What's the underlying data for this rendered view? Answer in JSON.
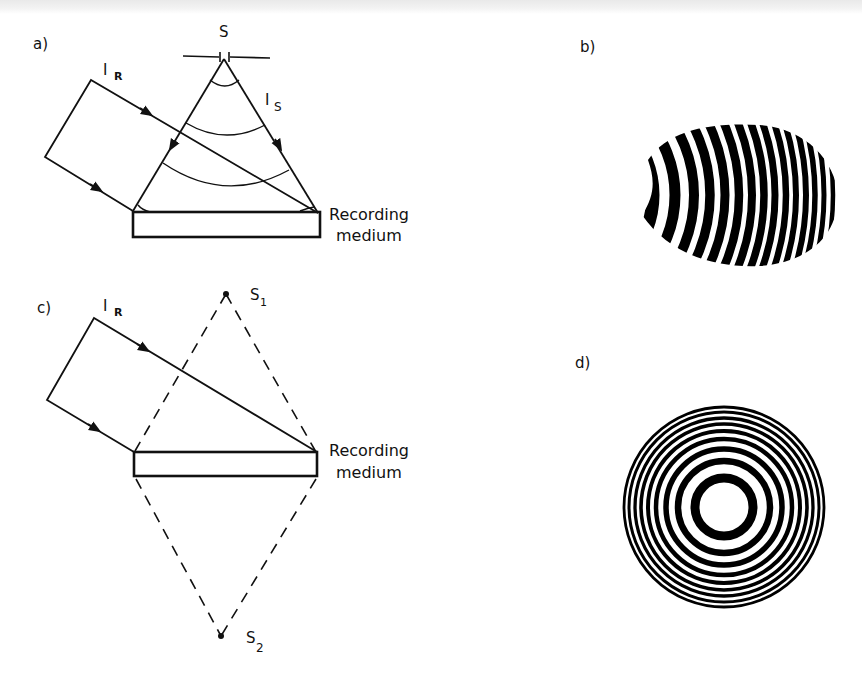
{
  "figure": {
    "panels": [
      {
        "id": "a",
        "label": "a)",
        "description": "Recording of a hologram of a point source S using reference beam I_R and spherical signal wave I_S",
        "source_label": "S",
        "reference_beam_label": "I",
        "reference_beam_sub": "R",
        "signal_beam_label": "I",
        "signal_beam_sub": "S",
        "medium_label_line1": "Recording",
        "medium_label_line2": "medium"
      },
      {
        "id": "b",
        "label": "b)",
        "description": "Off-axis interference fringe pattern (curved fringes in elliptical region)"
      },
      {
        "id": "c",
        "label": "c)",
        "description": "Reconstruction: reference beam I_R illuminates the hologram producing real and virtual point images S1 and S2",
        "source1_label": "S",
        "source1_sub": "1",
        "source2_label": "S",
        "source2_sub": "2",
        "reference_beam_label": "I",
        "reference_beam_sub": "R",
        "medium_label_line1": "Recording",
        "medium_label_line2": "medium"
      },
      {
        "id": "d",
        "label": "d)",
        "description": "On-axis zone plate pattern (concentric rings)"
      }
    ],
    "colors": {
      "ink": "#111111",
      "background": "#ffffff"
    }
  }
}
